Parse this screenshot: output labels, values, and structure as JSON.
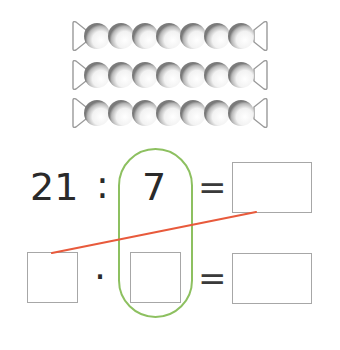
{
  "bead_strips": {
    "rows": 3,
    "beads_per_row": 7
  },
  "equation_top": {
    "dividend": "21",
    "operator": ":",
    "divisor": "7",
    "equals": "=",
    "result": ""
  },
  "equation_bottom": {
    "factor1": "",
    "operator": "·",
    "factor2": "",
    "equals": "=",
    "product": ""
  },
  "colors": {
    "highlight_oval": "#8dc060",
    "connector_line": "#e85a3c",
    "box_border": "#a7a7a7",
    "text": "#2a2a2a"
  }
}
